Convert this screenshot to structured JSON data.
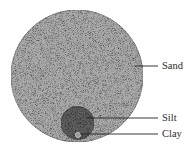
{
  "diagram": {
    "type": "particle-size-comparison",
    "particles": [
      {
        "name": "sand",
        "label": "Sand",
        "color": "#ababab"
      },
      {
        "name": "silt",
        "label": "Silt",
        "color": "#5e5e5e"
      },
      {
        "name": "clay",
        "label": "Clay",
        "color": "#9a9a9a"
      }
    ]
  }
}
